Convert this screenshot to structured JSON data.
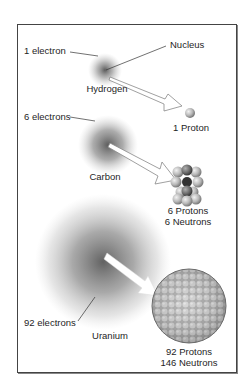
{
  "diagram": {
    "title": "",
    "atoms": [
      {
        "name": "Hydrogen",
        "electron_label": "1 electron",
        "nucleus_label_line1": "1 Proton",
        "nucleus_label_line2": "",
        "electrons": 1,
        "protons": 1,
        "neutrons": 0
      },
      {
        "name": "Carbon",
        "electron_label": "6 electrons",
        "nucleus_label_line1": "6 Protons",
        "nucleus_label_line2": "6 Neutrons",
        "electrons": 6,
        "protons": 6,
        "neutrons": 6
      },
      {
        "name": "Uranium",
        "electron_label": "92 electrons",
        "nucleus_label_line1": "92 Protons",
        "nucleus_label_line2": "146 Neutrons",
        "electrons": 92,
        "protons": 92,
        "neutrons": 146
      }
    ],
    "callouts": {
      "nucleus": "Nucleus"
    },
    "colors": {
      "cloud": "#555555",
      "frame": "#444444",
      "proton": "#bdbdbd",
      "neutron": "#8a8a8a"
    }
  }
}
